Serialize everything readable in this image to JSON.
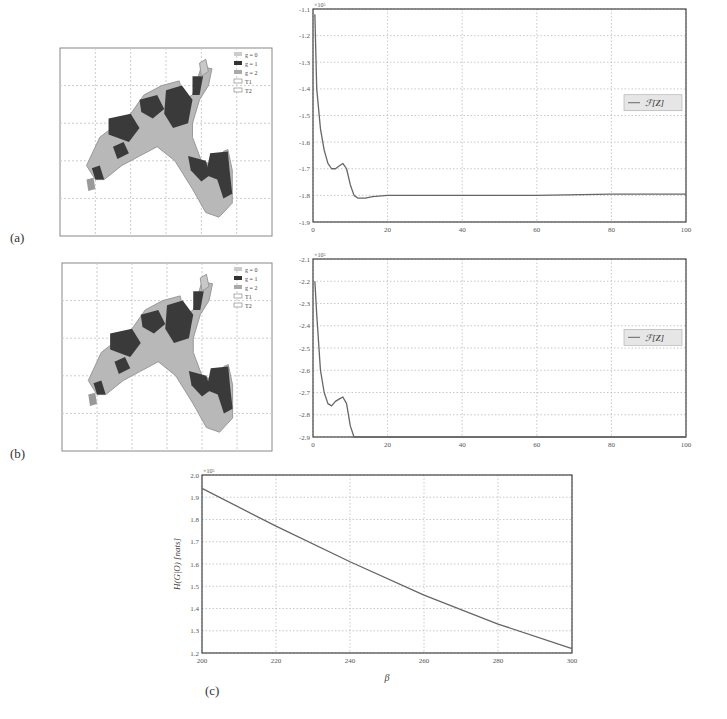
{
  "panel_labels": [
    "(a)",
    "(b)",
    "(c)"
  ],
  "map_legend": [
    "g = 0",
    "g = 1",
    "g = 2",
    "T1",
    "T2"
  ],
  "chart_data": [
    {
      "type": "line",
      "panel": "(a)",
      "title": "",
      "xlabel": "",
      "ylabel": "",
      "y_scale_note": "x10^5",
      "xlim": [
        0,
        100
      ],
      "ylim": [
        -1.9,
        -1.1
      ],
      "xticks": [
        0,
        20,
        40,
        60,
        80,
        100
      ],
      "yticks": [
        -1.1,
        -1.2,
        -1.3,
        -1.4,
        -1.5,
        -1.6,
        -1.7,
        -1.8,
        -1.9
      ],
      "grid": true,
      "legend": {
        "position": "right",
        "entries": [
          "F[Z]"
        ]
      },
      "series": [
        {
          "name": "F[Z]",
          "x": [
            0.5,
            1,
            2,
            3,
            4,
            5,
            6,
            7,
            8,
            9,
            10,
            11,
            12,
            13,
            14,
            16,
            20,
            40,
            60,
            80,
            100
          ],
          "values": [
            -1.12,
            -1.4,
            -1.55,
            -1.63,
            -1.68,
            -1.7,
            -1.7,
            -1.69,
            -1.68,
            -1.7,
            -1.76,
            -1.8,
            -1.81,
            -1.81,
            -1.81,
            -1.805,
            -1.8,
            -1.8,
            -1.8,
            -1.795,
            -1.795
          ]
        }
      ]
    },
    {
      "type": "line",
      "panel": "(b)",
      "title": "",
      "xlabel": "",
      "ylabel": "",
      "y_scale_note": "x10^5",
      "xlim": [
        0,
        100
      ],
      "ylim": [
        -2.9,
        -2.1
      ],
      "xticks": [
        0,
        20,
        40,
        60,
        80,
        100
      ],
      "yticks": [
        -2.1,
        -2.2,
        -2.3,
        -2.4,
        -2.5,
        -2.6,
        -2.7,
        -2.8,
        -2.9
      ],
      "grid": true,
      "legend": {
        "position": "right",
        "entries": [
          "F[Z]"
        ]
      },
      "series": [
        {
          "name": "F[Z]",
          "x": [
            0.5,
            1,
            2,
            3,
            4,
            5,
            6,
            7,
            8,
            9,
            10,
            11,
            12,
            20,
            40,
            60,
            80,
            100
          ],
          "values": [
            -2.2,
            -2.35,
            -2.6,
            -2.7,
            -2.75,
            -2.76,
            -2.74,
            -2.73,
            -2.72,
            -2.75,
            -2.85,
            -2.9,
            -2.9,
            -2.9,
            -2.9,
            -2.9,
            -2.9,
            -2.9
          ]
        }
      ]
    },
    {
      "type": "line",
      "panel": "(c)",
      "title": "",
      "xlabel": "β",
      "ylabel": "H(G|O) [nats]",
      "y_scale_note": "x10^5",
      "xlim": [
        200,
        300
      ],
      "ylim": [
        1.2,
        2.0
      ],
      "xticks": [
        200,
        220,
        240,
        260,
        280,
        300
      ],
      "yticks": [
        2.0,
        1.9,
        1.8,
        1.7,
        1.6,
        1.5,
        1.4,
        1.3,
        1.2
      ],
      "grid": true,
      "series": [
        {
          "name": "H(G|O)",
          "x": [
            200,
            220,
            240,
            260,
            280,
            300
          ],
          "values": [
            1.94,
            1.77,
            1.61,
            1.46,
            1.33,
            1.22
          ]
        }
      ]
    }
  ]
}
